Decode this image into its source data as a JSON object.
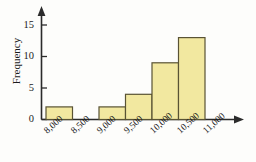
{
  "chart_data": {
    "type": "bar",
    "title": "",
    "subtitle": "",
    "xlabel": "",
    "ylabel": "Frequency",
    "bin_edges": [
      "8,000",
      "8,500",
      "9,000",
      "9,500",
      "10,000",
      "10,500",
      "11,000"
    ],
    "categories": [
      "8,000-8,500",
      "8,500-9,000",
      "9,000-9,500",
      "9,500-10,000",
      "10,000-10,500",
      "10,500-11,000"
    ],
    "values": [
      2,
      0,
      2,
      4,
      9,
      13
    ],
    "ylim": [
      0,
      16
    ],
    "yticks": [
      0,
      5,
      10,
      15
    ],
    "ytick_labels": [
      "0",
      "5",
      "10",
      "15"
    ],
    "grid": false,
    "legend": "none",
    "bar_fill_color": "#f2e8a0",
    "bar_edge_color": "#595334",
    "axis_color": "#2b2b2b",
    "background_color": "#fdfdfb"
  },
  "axes": {
    "y_axis_name": "Frequency",
    "y_tick_0": "0",
    "y_tick_1": "5",
    "y_tick_2": "10",
    "y_tick_3": "15",
    "x_tick_0": "8,000",
    "x_tick_1": "8,500",
    "x_tick_2": "9,000",
    "x_tick_3": "9,500",
    "x_tick_4": "10,000",
    "x_tick_5": "10,500",
    "x_tick_6": "11,000"
  }
}
